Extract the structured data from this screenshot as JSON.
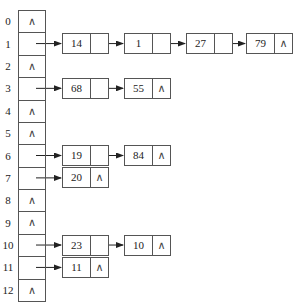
{
  "diagram": {
    "type": "hash-table-separate-chaining",
    "null_symbol": "∧",
    "buckets": [
      {
        "index": "0",
        "chain": []
      },
      {
        "index": "1",
        "chain": [
          "14",
          "1",
          "27",
          "79"
        ]
      },
      {
        "index": "2",
        "chain": []
      },
      {
        "index": "3",
        "chain": [
          "68",
          "55"
        ]
      },
      {
        "index": "4",
        "chain": []
      },
      {
        "index": "5",
        "chain": []
      },
      {
        "index": "6",
        "chain": [
          "19",
          "84"
        ]
      },
      {
        "index": "7",
        "chain": [
          "20"
        ]
      },
      {
        "index": "8",
        "chain": []
      },
      {
        "index": "9",
        "chain": []
      },
      {
        "index": "10",
        "chain": [
          "23",
          "10"
        ]
      },
      {
        "index": "11",
        "chain": [
          "11"
        ]
      },
      {
        "index": "12",
        "chain": []
      }
    ],
    "colors": {
      "line": "#555555",
      "text": "#222222",
      "background": "#ffffff"
    }
  }
}
